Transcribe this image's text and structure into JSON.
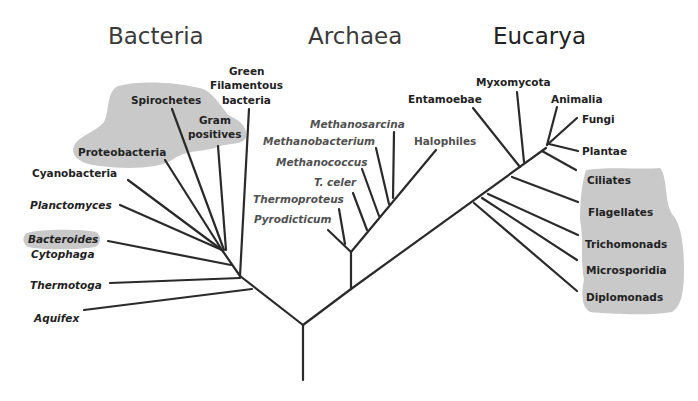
{
  "titles": {
    "bacteria": "Bacteria",
    "archaea": "Archaea",
    "eucarya": "Eucarya"
  },
  "bacteria": {
    "green_1": "Green",
    "green_2": "Filamentous",
    "green_3": "bacteria",
    "spirochetes": "Spirochetes",
    "gram_1": "Gram",
    "gram_2": "positives",
    "proteobacteria": "Proteobacteria",
    "cyanobacteria": "Cyanobacteria",
    "planctomyces": "Planctomyces",
    "bacteroides": "Bacteroides",
    "cytophaga": "Cytophaga",
    "thermotoga": "Thermotoga",
    "aquifex": "Aquifex"
  },
  "archaea": {
    "methanosarcina": "Methanosarcina",
    "methanobacterium": "Methanobacterium",
    "methanococcus": "Methanococcus",
    "t_celer": "T. celer",
    "thermoproteus": "Thermoproteus",
    "pyrodicticum": "Pyrodicticum",
    "halophiles": "Halophiles"
  },
  "eucarya": {
    "entamoebae": "Entamoebae",
    "myxomycota": "Myxomycota",
    "animalia": "Animalia",
    "fungi": "Fungi",
    "plantae": "Plantae",
    "ciliates": "Ciliates",
    "flagellates": "Flagellates",
    "trichomonads": "Trichomonads",
    "microsporidia": "Microsporidia",
    "diplomonads": "Diplomonads"
  },
  "colors": {
    "highlight": "#c9c9c9",
    "lines": "#2a2a2a"
  }
}
